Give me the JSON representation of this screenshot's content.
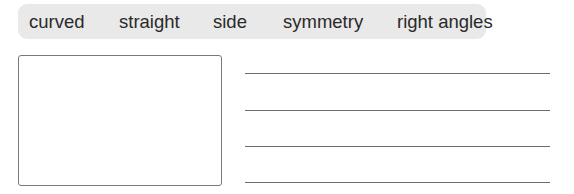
{
  "word_bank": {
    "words": [
      "curved",
      "straight",
      "side",
      "symmetry",
      "right angles"
    ],
    "background": "#e9e9e9"
  },
  "drawing_box": {
    "label": ""
  },
  "answer_lines": {
    "count": 4
  }
}
